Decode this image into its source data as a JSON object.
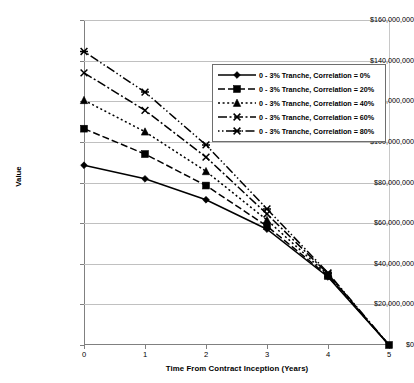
{
  "chart_data": {
    "type": "line",
    "title": "",
    "xlabel": "Time From Contract Inception (Years)",
    "ylabel": "Value",
    "x": [
      0,
      1,
      2,
      3,
      4,
      5
    ],
    "xlim": [
      0,
      5
    ],
    "ylim": [
      0,
      160000000
    ],
    "xticks": [
      "0",
      "1",
      "2",
      "3",
      "4",
      "5"
    ],
    "yticks": [
      "$0",
      "$20,000,000",
      "$40,000,000",
      "$60,000,000",
      "$80,000,000",
      "$100,000,000",
      "$120,000,000",
      "$140,000,000",
      "$160,000,000"
    ],
    "ytick_values": [
      0,
      20000000,
      40000000,
      60000000,
      80000000,
      100000000,
      120000000,
      140000000,
      160000000
    ],
    "grid": true,
    "legend_position": "upper-right",
    "series": [
      {
        "name": "0 - 3% Tranche, Correlation = 0%",
        "marker": "diamond",
        "dash": "solid",
        "values": [
          88500000,
          81800000,
          71500000,
          57000000,
          33500000,
          0
        ]
      },
      {
        "name": "0 - 3% Tranche, Correlation = 20%",
        "marker": "square",
        "dash": "dashed",
        "values": [
          106500000,
          94000000,
          78500000,
          58500000,
          34000000,
          0
        ]
      },
      {
        "name": "0 - 3% Tranche, Correlation = 40%",
        "marker": "triangle",
        "dash": "dotted",
        "values": [
          120500000,
          105000000,
          85500000,
          61500000,
          34500000,
          0
        ]
      },
      {
        "name": "0 - 3% Tranche, Correlation = 60%",
        "marker": "cross",
        "dash": "dashdot",
        "values": [
          134000000,
          115500000,
          92500000,
          64500000,
          35000000,
          0
        ]
      },
      {
        "name": "0 - 3% Tranche, Correlation = 80%",
        "marker": "asterisk",
        "dash": "longdashdot",
        "values": [
          144500000,
          124500000,
          98500000,
          67000000,
          35500000,
          0
        ]
      }
    ]
  },
  "axis": {
    "x_title": "Time From Contract Inception (Years)",
    "y_title": "Value"
  },
  "legend": {
    "items": [
      {
        "label": "0 - 3% Tranche, Correlation = 0%"
      },
      {
        "label": "0 - 3% Tranche, Correlation = 20%"
      },
      {
        "label": "0 - 3% Tranche, Correlation = 40%"
      },
      {
        "label": "0 - 3% Tranche, Correlation = 60%"
      },
      {
        "label": "0 - 3% Tranche, Correlation = 80%"
      }
    ]
  },
  "colors": {
    "series": "#000000",
    "grid": "#c0c0c0",
    "axis": "#808080",
    "background": "#ffffff"
  }
}
